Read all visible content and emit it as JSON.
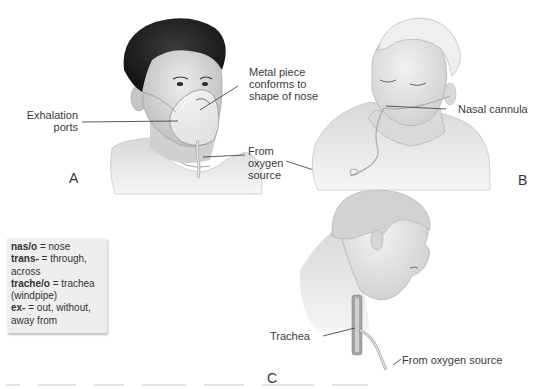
{
  "figure": {
    "panels": [
      {
        "letter": "A",
        "description": "Young man wearing a simple oxygen face mask",
        "labels": {
          "metal_piece": [
            "Metal piece",
            "conforms to",
            "shape of nose"
          ],
          "exhalation_ports": [
            "Exhalation",
            "ports"
          ],
          "oxygen_source": [
            "From",
            "oxygen",
            "source"
          ]
        }
      },
      {
        "letter": "B",
        "description": "Man with nasal cannula looking down",
        "labels": {
          "nasal_cannula": "Nasal cannula"
        }
      },
      {
        "letter": "C",
        "description": "Profile of man with tracheostomy oxygen delivery",
        "labels": {
          "trachea": "Trachea",
          "oxygen_source": "From oxygen source"
        }
      }
    ]
  },
  "glossary": {
    "entries": [
      {
        "term": "nas/o",
        "definition": " = nose"
      },
      {
        "term": "trans-",
        "definition": " = through,"
      },
      {
        "term": "",
        "definition": "across"
      },
      {
        "term": "trache/o",
        "definition": " = trachea"
      },
      {
        "term": "",
        "definition": "(windpipe)"
      },
      {
        "term": "ex-",
        "definition": " = out, without,"
      },
      {
        "term": "",
        "definition": "away from"
      }
    ]
  },
  "colors": {
    "background": "#ffffff",
    "glossary_bg": "#eeeeee",
    "text": "#333333",
    "hair_dark": "#2a2a2a",
    "skin_light": "#e2e2e2",
    "skin_shade": "#c8c8c8"
  }
}
